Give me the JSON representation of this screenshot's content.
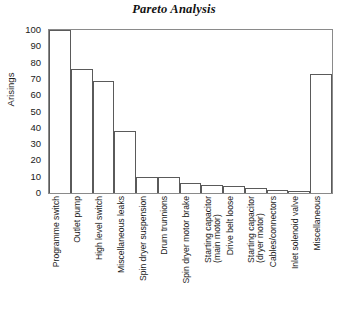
{
  "chart_data": {
    "type": "bar",
    "title": "Pareto Analysis",
    "xlabel": "",
    "ylabel": "Arisings",
    "ylim": [
      0,
      100
    ],
    "yticks": [
      0,
      10,
      20,
      30,
      40,
      50,
      60,
      70,
      80,
      90,
      100
    ],
    "grid": false,
    "legend": null,
    "bar_style": {
      "fill": "#ffffff",
      "edge": "#5a5a5a"
    },
    "categories": [
      "Programme switch",
      "Outlet pump",
      "High level switch",
      "Miscellaneous leaks",
      "Spin dryer suspension",
      "Drum trunnions",
      "Spin dryer motor brake",
      "Starting capacitor\n(main motor)",
      "Drive belt loose",
      "Starting capacitor\n(dryer motor)",
      "Cables/connectors",
      "Inlet solenoid valve",
      "Miscellaneous"
    ],
    "values": [
      100,
      76,
      69,
      38,
      10,
      10,
      6,
      5,
      4,
      3,
      2,
      1,
      73
    ]
  },
  "axes": {
    "ylabel": "Arisings",
    "ytick_labels": [
      "100",
      "90",
      "80",
      "70",
      "60",
      "50",
      "40",
      "30",
      "20",
      "10",
      "0"
    ]
  }
}
